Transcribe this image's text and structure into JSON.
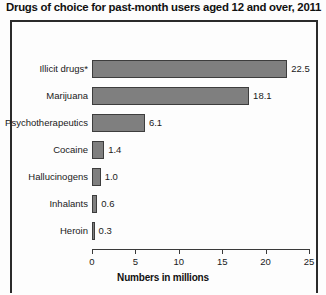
{
  "chart_data": {
    "type": "bar",
    "orientation": "horizontal",
    "title": "Drugs of choice for past-month users aged 12 and over, 2011",
    "categories": [
      "Illicit drugs*",
      "Marijuana",
      "Psychotherapeutics",
      "Cocaine",
      "Hallucinogens",
      "Inhalants",
      "Heroin"
    ],
    "values": [
      22.5,
      18.1,
      6.1,
      1.4,
      1.0,
      0.6,
      0.3
    ],
    "value_labels": [
      "22.5",
      "18.1",
      "6.1",
      "1.4",
      "1.0",
      "0.6",
      "0.3"
    ],
    "xlabel": "Numbers in millions",
    "ylabel": "",
    "xlim": [
      0,
      25
    ],
    "xticks": [
      0,
      5,
      10,
      15,
      20,
      25
    ],
    "xtick_labels": [
      "0",
      "5",
      "10",
      "15",
      "20",
      "25"
    ],
    "grid": false,
    "legend": false,
    "bar_color": "#7f7f7f",
    "bar_border_color": "#3d3d3d",
    "axis_color": "#3a3a3a",
    "text_color": "#1a1a1a",
    "background": "#fdfdfd"
  }
}
